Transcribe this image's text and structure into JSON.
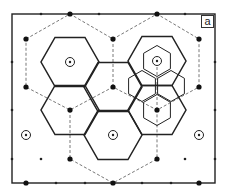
{
  "figure": {
    "panel_label": "a",
    "colors": {
      "stroke": "#222222",
      "dashed": "#555555",
      "background": "#ffffff"
    },
    "frame": {
      "x1": 12,
      "y1": 14,
      "x2": 215,
      "y2": 183
    },
    "large_dots": [
      [
        70,
        14
      ],
      [
        157,
        14
      ],
      [
        26,
        39
      ],
      [
        113,
        39
      ],
      [
        199,
        39
      ],
      [
        26,
        87
      ],
      [
        113,
        87
      ],
      [
        199,
        87
      ],
      [
        70,
        110
      ],
      [
        157,
        110
      ],
      [
        70,
        159
      ],
      [
        157,
        159
      ],
      [
        26,
        183
      ],
      [
        113,
        183
      ],
      [
        199,
        183
      ]
    ],
    "small_dots": [
      [
        41,
        14
      ],
      [
        99,
        14
      ],
      [
        185,
        14
      ],
      [
        12,
        62
      ],
      [
        215,
        62
      ],
      [
        12,
        110
      ],
      [
        215,
        110
      ],
      [
        12,
        159
      ],
      [
        41,
        159
      ],
      [
        185,
        159
      ],
      [
        215,
        159
      ],
      [
        56,
        183
      ],
      [
        85,
        183
      ],
      [
        142,
        183
      ],
      [
        171,
        183
      ]
    ],
    "circled_sites": [
      [
        70,
        62
      ],
      [
        157,
        61
      ],
      [
        26,
        135
      ],
      [
        113,
        135
      ],
      [
        199,
        135
      ]
    ],
    "large_hexagons": [
      {
        "cx": 70,
        "cy": 62
      },
      {
        "cx": 157,
        "cy": 61
      },
      {
        "cx": 113,
        "cy": 87
      },
      {
        "cx": 70,
        "cy": 110
      },
      {
        "cx": 157,
        "cy": 110
      },
      {
        "cx": 113,
        "cy": 135
      }
    ],
    "small_hexagons": [
      {
        "cx": 157,
        "cy": 61
      },
      {
        "cx": 142,
        "cy": 86
      },
      {
        "cx": 171,
        "cy": 86
      },
      {
        "cx": 157,
        "cy": 110
      }
    ],
    "dashed_paths": [
      [
        [
          26,
          39
        ],
        [
          70,
          14
        ],
        [
          113,
          39
        ],
        [
          157,
          14
        ],
        [
          199,
          39
        ],
        [
          199,
          87
        ],
        [
          157,
          110
        ],
        [
          113,
          87
        ],
        [
          70,
          110
        ],
        [
          26,
          87
        ],
        [
          26,
          39
        ]
      ],
      [
        [
          113,
          39
        ],
        [
          113,
          87
        ]
      ],
      [
        [
          70,
          110
        ],
        [
          70,
          159
        ],
        [
          113,
          183
        ],
        [
          157,
          159
        ],
        [
          157,
          110
        ]
      ],
      [
        [
          157,
          110
        ],
        [
          157,
          61
        ]
      ]
    ]
  }
}
